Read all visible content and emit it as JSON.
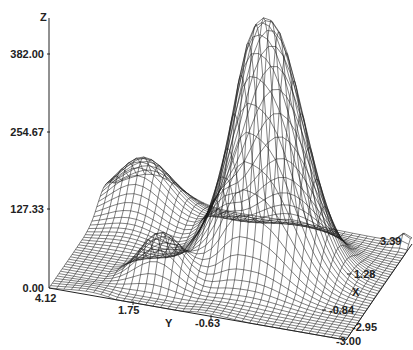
{
  "chart_data": {
    "type": "surface-wireframe",
    "title": "",
    "axes": {
      "z": {
        "label": "Z",
        "ticks": [
          "0.00",
          "127.33",
          "254.67",
          "382.00"
        ],
        "range": [
          0,
          382
        ]
      },
      "y": {
        "label": "Y",
        "ticks": [
          "4.12",
          "1.75",
          "-0.63",
          "-3.00"
        ],
        "range": [
          -3.0,
          4.12
        ]
      },
      "x": {
        "label": "X",
        "ticks": [
          "-2.95",
          "-0.84",
          "1.28",
          "3.39"
        ],
        "range": [
          -2.95,
          3.39
        ]
      }
    },
    "grid": false,
    "line_color": "#1a1a1a",
    "background": "#ffffff",
    "features": {
      "main_peak": {
        "x": 0.6,
        "y": -0.4,
        "z": 430,
        "note": "tall peak with ridge on left flank"
      },
      "shoulder_plateau": {
        "x": 1.8,
        "y": 3.2,
        "z": 120,
        "note": "flat raised plateau near Y=4.12 edge"
      },
      "minor_bump": {
        "x": -1.6,
        "y": 0.9,
        "z": 95
      },
      "corner_spike": {
        "x": 3.39,
        "y": -3.0,
        "z": 20
      }
    },
    "mesh_resolution": [
      40,
      40
    ]
  },
  "labels": {
    "z_axis": "Z",
    "z_ticks": [
      "382.00",
      "254.67",
      "127.33",
      "0.00"
    ],
    "y_axis": "Y",
    "y_ticks": [
      "4.12",
      "1.75",
      "-0.63",
      "-3.00"
    ],
    "x_axis": "X",
    "x_ticks": [
      "-2.95",
      "-0.84",
      "1.28",
      "3.39"
    ]
  }
}
